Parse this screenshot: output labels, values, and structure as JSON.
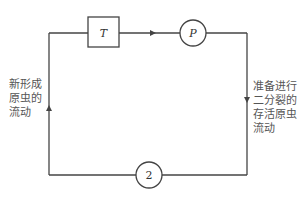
{
  "diagram": {
    "nodes": {
      "t_box": {
        "label": "T"
      },
      "p_circle": {
        "label": "P"
      },
      "two_circle": {
        "label": "2"
      }
    },
    "left_label": "新形成\n原虫的\n流动",
    "right_label": "准备进行\n二分裂的\n存活原虫\n流动",
    "colors": {
      "line": "#444444",
      "text": "#555555",
      "background": "#ffffff"
    }
  }
}
